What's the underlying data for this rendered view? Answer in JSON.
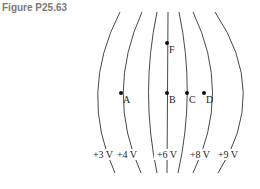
{
  "figure": {
    "title": "Figure P25.63"
  },
  "diagram": {
    "type": "equipotential-lines",
    "lines": [
      {
        "id": "line-3v",
        "label": "+3 V",
        "path": "M120,12 Q78,93 115,173",
        "label_x": 103
      },
      {
        "id": "line-4v",
        "label": "+4 V",
        "path": "M142,12 Q105,93 141,173",
        "label_x": 127
      },
      {
        "id": "line-5v",
        "label": "",
        "path": "M157,12 Q140,93 157,173",
        "label_x": null
      },
      {
        "id": "line-6v",
        "label": "+6 V",
        "path": "M168,12 L167,173",
        "label_x": 167
      },
      {
        "id": "line-7v",
        "label": "",
        "path": "M179,12 Q196,93 178,173",
        "label_x": null
      },
      {
        "id": "line-8v",
        "label": "+8 V",
        "path": "M193,12 Q232,93 193,173",
        "label_x": 200
      },
      {
        "id": "line-9v",
        "label": "+9 V",
        "path": "M215,12 Q270,93 218,173",
        "label_x": 228
      }
    ],
    "points": [
      {
        "id": "A",
        "label": "A",
        "x": 121,
        "y": 93
      },
      {
        "id": "B",
        "label": "B",
        "x": 167,
        "y": 93
      },
      {
        "id": "C",
        "label": "C",
        "x": 187,
        "y": 93
      },
      {
        "id": "D",
        "label": "D",
        "x": 204,
        "y": 93
      },
      {
        "id": "F",
        "label": "F",
        "x": 167,
        "y": 43
      }
    ]
  }
}
